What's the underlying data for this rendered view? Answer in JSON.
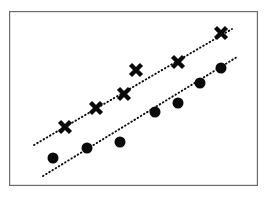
{
  "figure": {
    "title": "",
    "background_color": "#ffffff",
    "frame": {
      "x": 9,
      "y": 11,
      "width": 249,
      "height": 175,
      "stroke_color": "#6b6b6b",
      "stroke_width": 1.2,
      "fill_color": "#ffffff"
    }
  },
  "chart_data": {
    "type": "scatter",
    "title": "",
    "xlabel": "",
    "ylabel": "",
    "xlim": [
      0,
      100
    ],
    "ylim": [
      0,
      100
    ],
    "grid": false,
    "legend": "none",
    "axis_ticks": "none",
    "marker_color": "#0a0a0a",
    "trendline_style": "dotted",
    "trendline_color": "#0a0a0a",
    "series": [
      {
        "name": "Group X",
        "marker": "x",
        "marker_size": 11,
        "color": "#0a0a0a",
        "points": [
          {
            "px": 65,
            "py": 127,
            "x": 23.0,
            "y": 34.0
          },
          {
            "px": 96,
            "py": 108,
            "x": 35.5,
            "y": 45.0
          },
          {
            "px": 124,
            "py": 94,
            "x": 46.5,
            "y": 53.0
          },
          {
            "px": 136,
            "py": 70,
            "x": 51.5,
            "y": 66.5
          },
          {
            "px": 178,
            "py": 62,
            "x": 68.0,
            "y": 71.0
          },
          {
            "px": 221,
            "py": 33,
            "x": 85.0,
            "y": 87.5
          }
        ],
        "trendline": {
          "x1": 34,
          "y1": 145,
          "x2": 232,
          "y2": 29
        }
      },
      {
        "name": "Group O",
        "marker": "circle",
        "marker_size": 11,
        "color": "#0a0a0a",
        "points": [
          {
            "px": 53,
            "py": 158,
            "x": 18.0,
            "y": 16.0
          },
          {
            "px": 87,
            "py": 148,
            "x": 31.5,
            "y": 22.0
          },
          {
            "px": 120,
            "py": 142,
            "x": 44.5,
            "y": 25.5
          },
          {
            "px": 155,
            "py": 112,
            "x": 58.5,
            "y": 42.5
          },
          {
            "px": 178,
            "py": 103,
            "x": 68.0,
            "y": 47.5
          },
          {
            "px": 200,
            "py": 83,
            "x": 76.5,
            "y": 59.0
          },
          {
            "px": 221,
            "py": 68,
            "x": 85.0,
            "y": 67.5
          }
        ],
        "trendline": {
          "x1": 43,
          "y1": 176,
          "x2": 237,
          "y2": 57
        }
      }
    ]
  },
  "accessibility": {
    "description": "Scatter plot with two groups of data points and dotted trend lines"
  }
}
